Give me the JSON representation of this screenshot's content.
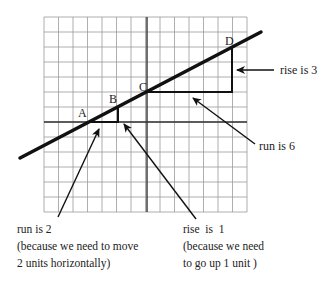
{
  "diagram": {
    "grid": {
      "columns": 14,
      "rows": 13,
      "x0": 44,
      "y0": 17,
      "dx": 14.5,
      "dy": 15,
      "color": "#9a9a9a"
    },
    "axes": {
      "x_axis_row": 7,
      "y_axis_col": 7,
      "color": "#333333"
    },
    "line": {
      "from": [
        20,
        158
      ],
      "to": [
        261,
        32
      ],
      "color": "#111111",
      "width": 3.5
    },
    "points": [
      {
        "label": "A",
        "x": 88,
        "y": 122,
        "label_x": 78,
        "label_y": 117
      },
      {
        "label": "B",
        "x": 118,
        "y": 107,
        "label_x": 109,
        "label_y": 102
      },
      {
        "label": "C",
        "x": 147,
        "y": 92,
        "label_x": 139,
        "label_y": 92
      },
      {
        "label": "D",
        "x": 232,
        "y": 48,
        "label_x": 225,
        "label_y": 44
      }
    ],
    "triangles": [
      {
        "name": "small",
        "run": 2,
        "rise": 1
      },
      {
        "name": "large",
        "run": 6,
        "rise": 3
      }
    ],
    "annotations": {
      "rise3": {
        "text": "rise is 3"
      },
      "run6": {
        "text": "run is 6"
      },
      "run2": {
        "lines": [
          "run is 2",
          "(because we need to move",
          "2 units horizontally)"
        ]
      },
      "rise1": {
        "lines": [
          "rise  is  1",
          "(because we need",
          "to go up 1 unit )"
        ]
      }
    }
  }
}
